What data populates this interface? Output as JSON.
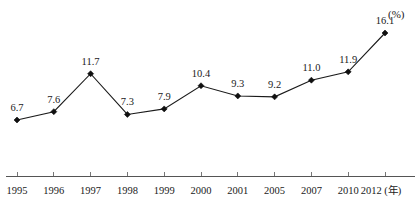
{
  "chart_data": {
    "type": "line",
    "title": "",
    "subtitle": "",
    "xlabel": "年",
    "ylabel": "",
    "unit_label": "(%)",
    "unit_label_position": "top-right",
    "grid": false,
    "legend": false,
    "legend_position": "none",
    "axis": {
      "x_axis_visible": true,
      "y_axis_visible": false,
      "x_tick_marks": true,
      "ylim": [
        0,
        17
      ]
    },
    "marker": "diamond",
    "line_color": "#1a1a1a",
    "marker_color": "#101010",
    "axis_color": "#555555",
    "categories": [
      "1995",
      "1996",
      "1997",
      "1998",
      "1999",
      "2000",
      "2001",
      "2005",
      "2007",
      "2010",
      "2012"
    ],
    "tick_labels": [
      "1995",
      "1996",
      "1997",
      "1998",
      "1999",
      "2000",
      "2001",
      "2005",
      "2007",
      "2010",
      "2012 (年)"
    ],
    "values": [
      6.7,
      7.6,
      11.7,
      7.3,
      7.9,
      10.4,
      9.3,
      9.2,
      11.0,
      11.9,
      16.1
    ],
    "data_labels": [
      "6.7",
      "7.6",
      "11.7",
      "7.3",
      "7.9",
      "10.4",
      "9.3",
      "9.2",
      "11.0",
      "11.9",
      "16.1"
    ]
  }
}
